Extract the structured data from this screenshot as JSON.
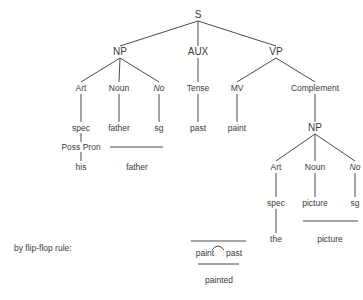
{
  "tree": {
    "root": "S",
    "level1": {
      "np": "NP",
      "aux": "AUX",
      "vp": "VP"
    },
    "level2": {
      "art": "Art",
      "noun": "Noun",
      "no": "No",
      "tense": "Tense",
      "mv": "MV",
      "complement": "Complement"
    },
    "level3": {
      "spec": "spec",
      "father": "father",
      "sg": "sg",
      "past": "past",
      "paint": "paint",
      "np": "NP"
    },
    "subject": {
      "poss_pron": "Poss Pron",
      "his": "his",
      "father_surface": "father"
    },
    "object": {
      "art": "Art",
      "noun": "Noun",
      "no": "No",
      "spec": "spec",
      "picture": "picture",
      "sg": "sg",
      "the": "the",
      "picture_surface": "picture"
    }
  },
  "rule": {
    "label": "by flip-flop rule:",
    "left": "paint",
    "right": "past",
    "result": "painted"
  }
}
